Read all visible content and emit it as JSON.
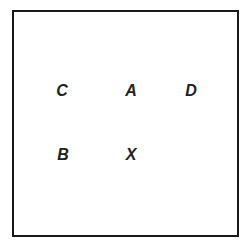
{
  "diagram": {
    "labels": [
      {
        "id": "C",
        "text": "C",
        "x": 62,
        "y": 91
      },
      {
        "id": "A",
        "text": "A",
        "x": 131,
        "y": 91
      },
      {
        "id": "D",
        "text": "D",
        "x": 191,
        "y": 91
      },
      {
        "id": "B",
        "text": "B",
        "x": 63,
        "y": 155
      },
      {
        "id": "X",
        "text": "X",
        "x": 131,
        "y": 155
      }
    ]
  }
}
